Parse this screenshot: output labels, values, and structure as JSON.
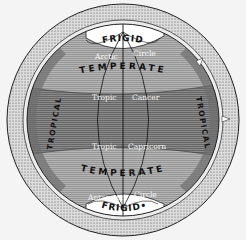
{
  "diagram": {
    "zones": {
      "north_frigid": "FRIGID",
      "north_temperate": "TEMPERATE",
      "tropical_left": "TROPICAL",
      "tropical_right": "TROPICAL",
      "south_temperate": "TEMPERATE",
      "south_frigid": "FRIGID•"
    },
    "circles": {
      "arctic_word1": "Arctic",
      "arctic_word2": "Circle",
      "cancer_word1": "Tropic",
      "cancer_word2": "Cancer",
      "capricorn_word1": "Tropic",
      "capricorn_word2": "Capricorn",
      "antarctic_word1": "Antarctic",
      "antarctic_word2": "Circle"
    },
    "colors": {
      "background": "#f4f4f4",
      "rim": "#cfcfcf",
      "temperate": "#a8a8a8",
      "tropical": "#7e7e7e",
      "frigid": "#ffffff",
      "ink": "#111111"
    }
  }
}
